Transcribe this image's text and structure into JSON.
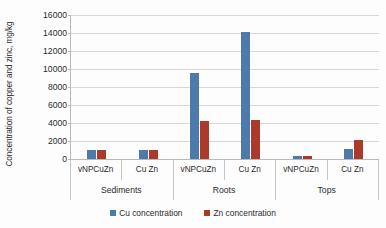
{
  "chart_data": {
    "type": "bar",
    "title": "",
    "xlabel": "",
    "ylabel": "Concentration of copper and zinc, mg/kg",
    "ylim": [
      0,
      16000
    ],
    "ytick_step": 2000,
    "yticks": [
      "16000",
      "14000",
      "12000",
      "10000",
      "8000",
      "6000",
      "4000",
      "2000",
      "0"
    ],
    "grid": true,
    "legend_position": "bottom",
    "groups": [
      "Sediments",
      "Roots",
      "Tops"
    ],
    "categories": [
      "vNPCuZn",
      "Cu Zn",
      "vNPCuZn",
      "Cu Zn",
      "vNPCuZn",
      "Cu Zn"
    ],
    "group_spans": [
      2,
      2,
      2
    ],
    "series": [
      {
        "name": "Cu concentration",
        "color": "#4b7aab",
        "values": [
          1000,
          1000,
          9600,
          14100,
          350,
          1150
        ]
      },
      {
        "name": "Zn concentration",
        "color": "#ab3a2b",
        "values": [
          1000,
          1000,
          4200,
          4300,
          350,
          2100
        ]
      }
    ]
  },
  "axis": {
    "y_title": "Concentration of copper and zinc, mg/kg"
  },
  "legend": {
    "items": [
      {
        "label": "Cu concentration",
        "color": "#4b7aab"
      },
      {
        "label": "Zn concentration",
        "color": "#ab3a2b"
      }
    ]
  }
}
